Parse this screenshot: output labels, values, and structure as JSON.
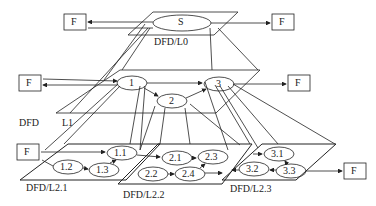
{
  "diagram": {
    "type": "layered data flow diagram decomposition",
    "levels": {
      "l0": {
        "label": "DFD/L0",
        "processes": [
          {
            "id": "S",
            "label": "S"
          }
        ],
        "externals": [
          {
            "label": "F"
          },
          {
            "label": "F"
          }
        ]
      },
      "l1": {
        "label_a": "DFD",
        "label_b": "L1",
        "processes": [
          {
            "label": "1"
          },
          {
            "label": "2"
          },
          {
            "label": "3"
          }
        ],
        "externals": [
          {
            "label": "F"
          },
          {
            "label": "F"
          }
        ]
      },
      "l2_1": {
        "label": "DFD/L2.1",
        "processes": [
          {
            "label": "1.1"
          },
          {
            "label": "1.2"
          },
          {
            "label": "1.3"
          }
        ],
        "externals": [
          {
            "label": "F"
          }
        ]
      },
      "l2_2": {
        "label": "DFD/L2.2",
        "processes": [
          {
            "label": "2.1"
          },
          {
            "label": "2.2"
          },
          {
            "label": "2.3"
          },
          {
            "label": "2.4"
          }
        ]
      },
      "l2_3": {
        "label": "DFD/L2.3",
        "processes": [
          {
            "label": "3.1"
          },
          {
            "label": "3.2"
          },
          {
            "label": "3.3"
          }
        ],
        "externals": [
          {
            "label": "F"
          }
        ]
      }
    }
  }
}
